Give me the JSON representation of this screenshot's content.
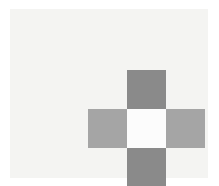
{
  "figure": {
    "canvas": {
      "width": 219,
      "height": 186,
      "background_color": "#ffffff"
    },
    "panel": {
      "background_color": "#f4f4f2",
      "left": 10,
      "top": 9,
      "width": 198,
      "height": 169
    },
    "palette": {
      "dark_gray": "#8a8a8a",
      "mid_gray": "#a5a5a5",
      "center_white": "#fcfcfc",
      "panel_offwhite": "#f4f4f2",
      "canvas_white": "#ffffff"
    },
    "grid": {
      "rows": 3,
      "columns": 3,
      "cell_size": 39,
      "origin_x": 88,
      "origin_y": 70
    },
    "cells": [
      {
        "row": 0,
        "col": 0,
        "role": "corner-top-left",
        "fill": "empty",
        "color": "#f4f4f2"
      },
      {
        "row": 0,
        "col": 1,
        "role": "arm-top",
        "fill": "dark",
        "color": "#8a8a8a"
      },
      {
        "row": 0,
        "col": 2,
        "role": "corner-top-right",
        "fill": "empty",
        "color": "#f4f4f2"
      },
      {
        "row": 1,
        "col": 0,
        "role": "arm-left",
        "fill": "mid",
        "color": "#a5a5a5"
      },
      {
        "row": 1,
        "col": 1,
        "role": "center",
        "fill": "center",
        "color": "#fcfcfc"
      },
      {
        "row": 1,
        "col": 2,
        "role": "arm-right",
        "fill": "mid",
        "color": "#a5a5a5"
      },
      {
        "row": 2,
        "col": 0,
        "role": "corner-bottom-left",
        "fill": "empty",
        "color": "#f4f4f2"
      },
      {
        "row": 2,
        "col": 1,
        "role": "arm-bottom",
        "fill": "dark",
        "color": "#8a8a8a"
      },
      {
        "row": 2,
        "col": 2,
        "role": "corner-bottom-right",
        "fill": "empty",
        "color": "#f4f4f2"
      }
    ]
  }
}
